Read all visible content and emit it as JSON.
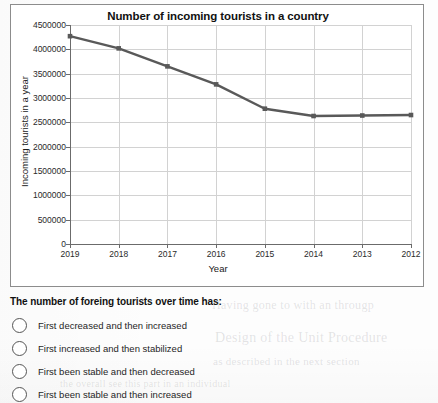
{
  "chart": {
    "title": "Number of incoming tourists in a country",
    "x_axis_title": "Year",
    "y_axis_title": "Incoming tourists in a year"
  },
  "chart_data": {
    "type": "line",
    "title": "Number of incoming tourists in a country",
    "xlabel": "Year",
    "ylabel": "Incoming tourists in a year",
    "categories": [
      "2019",
      "2018",
      "2017",
      "2016",
      "2015",
      "2014",
      "2013",
      "2012"
    ],
    "values": [
      4270000,
      4020000,
      3650000,
      3280000,
      2780000,
      2630000,
      2640000,
      2650000
    ],
    "ylim": [
      0,
      4500000
    ],
    "ytick_labels": [
      "0",
      "500000",
      "1000000",
      "1500000",
      "2000000",
      "2500000",
      "3000000",
      "3500000",
      "4000000",
      "4500000"
    ],
    "ytick_values": [
      0,
      500000,
      1000000,
      1500000,
      2000000,
      2500000,
      3000000,
      3500000,
      4000000,
      4500000
    ],
    "xtick_labels": [
      "2019",
      "2018",
      "2017",
      "2016",
      "2015",
      "2014",
      "2013",
      "2012"
    ],
    "grid": true,
    "legend": false,
    "series_color": "#595959",
    "marker": "square"
  },
  "question": {
    "prompt": "The number of foreing tourists over time has:",
    "options": [
      {
        "label": "First decreased and then increased",
        "selected": false
      },
      {
        "label": "First increased and then stabilized",
        "selected": false
      },
      {
        "label": "First been stable and then decreased",
        "selected": false
      },
      {
        "label": "First been stable and then increased",
        "selected": false
      }
    ]
  },
  "background_text": [
    "Having gone to with an througp",
    "Design of the  Unit Procedure",
    "as described in the next section",
    "the overall see this part in an individual"
  ]
}
